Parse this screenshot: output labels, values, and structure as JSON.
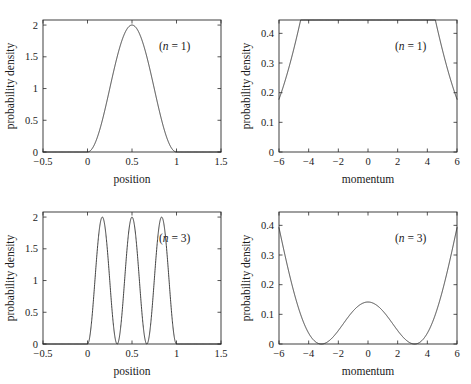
{
  "figure": {
    "background_color": "#ffffff",
    "line_color": "#2b2b2b",
    "text_color": "#1a1a1a",
    "layout": "2x2 grid of line plots"
  },
  "chart_data": [
    {
      "id": "position-n1",
      "type": "line",
      "title": "",
      "xlabel": "position",
      "ylabel": "probability density",
      "annotation": "(n = 1)",
      "annotation_symbol": "n",
      "annotation_value": "1",
      "xlim": [
        -0.5,
        1.5
      ],
      "ylim": [
        0,
        2.08
      ],
      "xticks": [
        -0.5,
        0,
        0.5,
        1,
        1.5
      ],
      "xticklabels": [
        "−0.5",
        "0",
        "0.5",
        "1",
        "1.5"
      ],
      "yticks": [
        0,
        0.5,
        1,
        1.5,
        2
      ],
      "yticklabels": [
        "0",
        "0.5",
        "1",
        "1.5",
        "2"
      ],
      "grid": false,
      "legend": "none",
      "formula": "2*sin(pi*x)^2 on [0,1], 0 elsewhere",
      "peak_x": 0.5,
      "peak_y": 2.0,
      "support": [
        0,
        1
      ],
      "x": [
        -0.5,
        -0.25,
        0,
        0.05,
        0.1,
        0.15,
        0.2,
        0.25,
        0.3,
        0.35,
        0.4,
        0.45,
        0.5,
        0.55,
        0.6,
        0.65,
        0.7,
        0.75,
        0.8,
        0.85,
        0.9,
        0.95,
        1,
        1.25,
        1.5
      ],
      "values": [
        0,
        0,
        0,
        0.049,
        0.191,
        0.416,
        0.691,
        1.0,
        1.309,
        1.584,
        1.809,
        1.951,
        2.0,
        1.951,
        1.809,
        1.584,
        1.309,
        1.0,
        0.691,
        0.416,
        0.191,
        0.049,
        0,
        0,
        0
      ]
    },
    {
      "id": "momentum-n1",
      "type": "line",
      "title": "",
      "xlabel": "momentum",
      "ylabel": "probability density",
      "annotation": "(n = 1)",
      "annotation_symbol": "n",
      "annotation_value": "1",
      "xlim": [
        -6,
        6
      ],
      "ylim": [
        0,
        0.445
      ],
      "xticks": [
        -6,
        -4,
        -2,
        0,
        2,
        4,
        6
      ],
      "xticklabels": [
        "−6",
        "−4",
        "−2",
        "0",
        "2",
        "4",
        "6"
      ],
      "yticks": [
        0,
        0.1,
        0.2,
        0.3,
        0.4
      ],
      "yticklabels": [
        "0",
        "0.1",
        "0.2",
        "0.3",
        "0.4"
      ],
      "grid": false,
      "legend": "none",
      "formula": "(4*pi/ (pi^2-k^2)^2)*cos(k/2)^2  (n=1 box momentum density)",
      "peak_x": 0,
      "peak_y": 0.405,
      "zeros": [
        -3.0,
        3.0
      ],
      "x": [
        -6,
        -5,
        -4.5,
        -4,
        -3.5,
        -3,
        -2.5,
        -2,
        -1.5,
        -1,
        -0.5,
        0,
        0.5,
        1,
        1.5,
        2,
        2.5,
        3,
        3.5,
        4,
        4.5,
        5,
        6
      ],
      "values": [
        0.0,
        0.001,
        0.002,
        0.004,
        0.006,
        0.0,
        0.017,
        0.056,
        0.135,
        0.243,
        0.348,
        0.405,
        0.348,
        0.243,
        0.135,
        0.056,
        0.017,
        0.0,
        0.006,
        0.004,
        0.002,
        0.001,
        0.0
      ]
    },
    {
      "id": "position-n3",
      "type": "line",
      "title": "",
      "xlabel": "position",
      "ylabel": "probability density",
      "annotation": "(n = 3)",
      "annotation_symbol": "n",
      "annotation_value": "3",
      "xlim": [
        -0.5,
        1.5
      ],
      "ylim": [
        0,
        2.08
      ],
      "xticks": [
        -0.5,
        0,
        0.5,
        1,
        1.5
      ],
      "xticklabels": [
        "−0.5",
        "0",
        "0.5",
        "1",
        "1.5"
      ],
      "yticks": [
        0,
        0.5,
        1,
        1.5,
        2
      ],
      "yticklabels": [
        "0",
        "0.5",
        "1",
        "1.5",
        "2"
      ],
      "grid": false,
      "legend": "none",
      "formula": "2*sin(3*pi*x)^2 on [0,1], 0 elsewhere",
      "peaks_x": [
        0.1667,
        0.5,
        0.8333
      ],
      "peaks_y": [
        2.0,
        2.0,
        2.0
      ],
      "nodes_x": [
        0,
        0.3333,
        0.6667,
        1.0
      ],
      "support": [
        0,
        1
      ],
      "x": [
        -0.5,
        0,
        0.0833,
        0.1667,
        0.25,
        0.3333,
        0.4167,
        0.5,
        0.5833,
        0.6667,
        0.75,
        0.8333,
        0.9167,
        1,
        1.5
      ],
      "values": [
        0,
        0,
        1.0,
        2.0,
        1.0,
        0,
        1.0,
        2.0,
        1.0,
        0,
        1.0,
        2.0,
        1.0,
        0,
        0
      ]
    },
    {
      "id": "momentum-n3",
      "type": "line",
      "title": "",
      "xlabel": "momentum",
      "ylabel": "probability density",
      "annotation": "(n = 3)",
      "annotation_symbol": "n",
      "annotation_value": "3",
      "xlim": [
        -6,
        6
      ],
      "ylim": [
        0,
        0.445
      ],
      "xticks": [
        -6,
        -4,
        -2,
        0,
        2,
        4,
        6
      ],
      "xticklabels": [
        "−6",
        "−4",
        "−2",
        "0",
        "2",
        "4",
        "6"
      ],
      "yticks": [
        0,
        0.1,
        0.2,
        0.3,
        0.4
      ],
      "yticklabels": [
        "0",
        "0.1",
        "0.2",
        "0.3",
        "0.4"
      ],
      "grid": false,
      "legend": "none",
      "formula": "(36*pi/(9*pi^2-k^2)^2)*cos(k/2)^2 scaled (n=3 box momentum density)",
      "main_peaks_x": [
        -2.8,
        2.8
      ],
      "main_peaks_y": [
        0.26,
        0.26
      ],
      "center_bump_x": 0,
      "center_bump_y": 0.045,
      "zeros": [
        -5.0,
        -1.0,
        1.0,
        5.0
      ],
      "x": [
        -6,
        -5.5,
        -5,
        -4.5,
        -4,
        -3.5,
        -3,
        -2.8,
        -2.5,
        -2,
        -1.5,
        -1,
        -0.5,
        0,
        0.5,
        1,
        1.5,
        2,
        2.5,
        2.8,
        3,
        3.5,
        4,
        4.5,
        5,
        5.5,
        6
      ],
      "values": [
        0.002,
        0.001,
        0.0,
        0.047,
        0.152,
        0.235,
        0.259,
        0.26,
        0.243,
        0.159,
        0.062,
        0.0,
        0.031,
        0.045,
        0.031,
        0.0,
        0.062,
        0.159,
        0.243,
        0.26,
        0.259,
        0.235,
        0.152,
        0.047,
        0.0,
        0.001,
        0.002
      ]
    }
  ]
}
